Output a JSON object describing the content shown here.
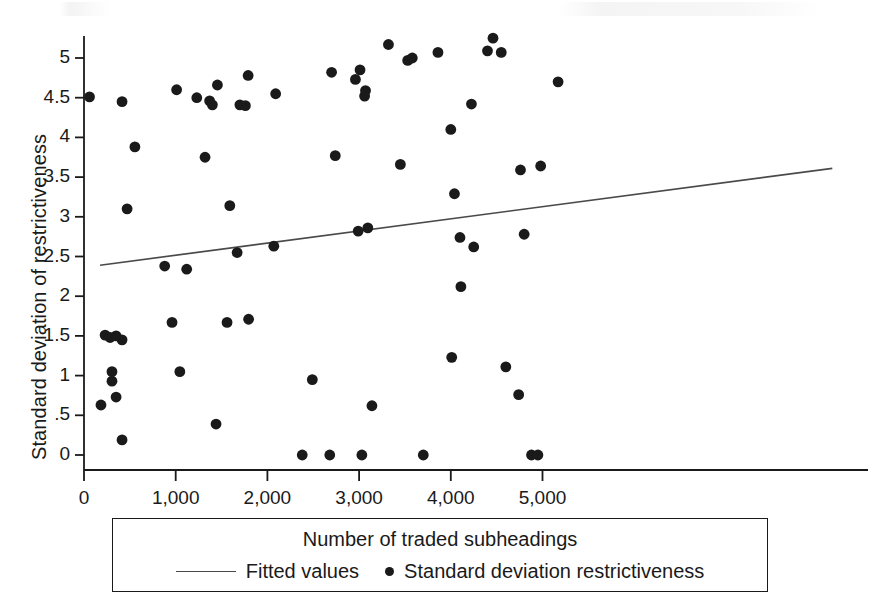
{
  "chart_data": {
    "type": "scatter",
    "title": "",
    "xlabel": "Number of traded subheadings",
    "ylabel": "Standard deviation of restrictiveness",
    "xlim": [
      -260,
      5400
    ],
    "ylim": [
      -0.2,
      5.35
    ],
    "grid": false,
    "x_ticks": [
      0,
      1000,
      2000,
      3000,
      4000,
      5000
    ],
    "x_tick_labels": [
      "0",
      "1,000",
      "2,000",
      "3,000",
      "4,000",
      "5,000"
    ],
    "y_ticks": [
      0,
      0.5,
      1,
      1.5,
      2,
      2.5,
      3,
      3.5,
      4,
      4.5,
      5
    ],
    "y_tick_labels": [
      "0",
      ".5",
      "1",
      "1.5",
      "2",
      "2.5",
      "3",
      "3.5",
      "4",
      "4.5",
      "5"
    ],
    "legend_position": "below-axis",
    "legend": [
      {
        "label": "Fitted values",
        "marker": "line",
        "color": "#4a4a4a"
      },
      {
        "label": "Standard deviation restrictiveness",
        "marker": "dot",
        "color": "#1a1a1a"
      }
    ],
    "series": [
      {
        "name": "Standard deviation restrictiveness",
        "type": "scatter",
        "marker": "filled-circle",
        "color": "#1a1a1a",
        "points": [
          [
            60,
            4.51
          ],
          [
            230,
            1.51
          ],
          [
            285,
            1.48
          ],
          [
            350,
            1.5
          ],
          [
            415,
            1.45
          ],
          [
            305,
            1.05
          ],
          [
            305,
            0.93
          ],
          [
            350,
            0.73
          ],
          [
            185,
            0.63
          ],
          [
            415,
            0.19
          ],
          [
            415,
            4.45
          ],
          [
            470,
            3.1
          ],
          [
            555,
            3.88
          ],
          [
            880,
            2.38
          ],
          [
            960,
            1.67
          ],
          [
            1010,
            4.6
          ],
          [
            1045,
            1.05
          ],
          [
            1120,
            2.34
          ],
          [
            1230,
            4.5
          ],
          [
            1320,
            3.75
          ],
          [
            1370,
            4.46
          ],
          [
            1400,
            4.41
          ],
          [
            1440,
            0.39
          ],
          [
            1455,
            4.66
          ],
          [
            1560,
            1.67
          ],
          [
            1590,
            3.14
          ],
          [
            1670,
            2.55
          ],
          [
            1700,
            4.41
          ],
          [
            1760,
            4.4
          ],
          [
            1790,
            4.78
          ],
          [
            1795,
            1.71
          ],
          [
            2070,
            2.63
          ],
          [
            2090,
            4.55
          ],
          [
            2380,
            0.0
          ],
          [
            2490,
            0.95
          ],
          [
            2680,
            0.0
          ],
          [
            2700,
            4.82
          ],
          [
            2740,
            3.77
          ],
          [
            2960,
            4.73
          ],
          [
            2990,
            2.82
          ],
          [
            3010,
            4.85
          ],
          [
            3030,
            0.0
          ],
          [
            3060,
            4.52
          ],
          [
            3070,
            4.59
          ],
          [
            3095,
            2.86
          ],
          [
            3140,
            0.62
          ],
          [
            3320,
            5.17
          ],
          [
            3450,
            3.66
          ],
          [
            3530,
            4.97
          ],
          [
            3580,
            5.0
          ],
          [
            3700,
            0.0
          ],
          [
            3860,
            5.07
          ],
          [
            4000,
            4.1
          ],
          [
            4010,
            1.23
          ],
          [
            4040,
            3.29
          ],
          [
            4100,
            2.74
          ],
          [
            4110,
            2.12
          ],
          [
            4225,
            4.42
          ],
          [
            4250,
            2.62
          ],
          [
            4400,
            5.09
          ],
          [
            4460,
            5.25
          ],
          [
            4550,
            5.07
          ],
          [
            4600,
            1.11
          ],
          [
            4740,
            0.76
          ],
          [
            4760,
            3.59
          ],
          [
            4800,
            2.78
          ],
          [
            4880,
            0.0
          ],
          [
            4950,
            0.0
          ],
          [
            4980,
            3.64
          ],
          [
            5170,
            4.7
          ]
        ]
      },
      {
        "name": "Fitted values",
        "type": "line",
        "color": "#4a4a4a",
        "endpoints": [
          [
            175,
            2.39
          ],
          [
            8160,
            3.61
          ]
        ],
        "x_range": [
          175,
          8160
        ],
        "y_range": [
          2.39,
          3.61
        ]
      }
    ]
  }
}
